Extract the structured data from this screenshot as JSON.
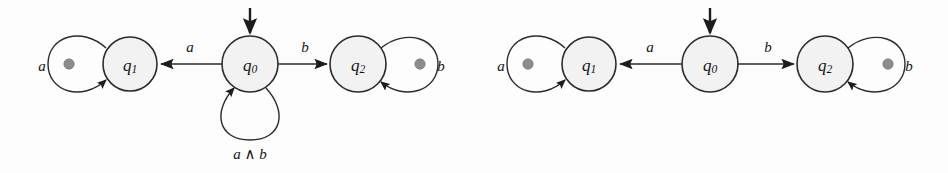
{
  "figure": {
    "background_color": "#fdfdfd",
    "stroke_color": "#2b2b2b",
    "state_fill_color": "#f2f2f2",
    "marker_dot_color": "#8c8c8c"
  },
  "automata": [
    {
      "id": "left-automaton",
      "states": [
        {
          "id": "q1",
          "name": "q",
          "subscript": "1",
          "cx": 130,
          "cy": 64,
          "r": 27
        },
        {
          "id": "q0",
          "name": "q",
          "subscript": "0",
          "cx": 250,
          "cy": 64,
          "r": 28,
          "initial": true
        },
        {
          "id": "q2",
          "name": "q",
          "subscript": "2",
          "cx": 358,
          "cy": 64,
          "r": 28
        }
      ],
      "transitions": [
        {
          "id": "q0-to-q1",
          "from": "q0",
          "to": "q1",
          "label": "a",
          "label_x": 190,
          "label_y": 47
        },
        {
          "id": "q0-to-q2",
          "from": "q0",
          "to": "q2",
          "label": "b",
          "label_x": 305,
          "label_y": 47
        },
        {
          "id": "q1-self",
          "from": "q1",
          "to": "q1",
          "label": "a",
          "label_x": 42,
          "label_y": 66,
          "self_loop": true,
          "side": "left",
          "dot": true
        },
        {
          "id": "q2-self",
          "from": "q2",
          "to": "q2",
          "label": "b",
          "label_x": 438,
          "label_y": 66,
          "self_loop": true,
          "side": "right",
          "dot": true
        },
        {
          "id": "q0-self",
          "from": "q0",
          "to": "q0",
          "label": "a ∧ b",
          "label_x": 250,
          "label_y": 152,
          "self_loop": true,
          "side": "bottom",
          "dot": false
        }
      ]
    },
    {
      "id": "right-automaton",
      "states": [
        {
          "id": "q1",
          "name": "q",
          "subscript": "1",
          "cx": 589,
          "cy": 64,
          "r": 27
        },
        {
          "id": "q0",
          "name": "q",
          "subscript": "0",
          "cx": 710,
          "cy": 64,
          "r": 28,
          "initial": true
        },
        {
          "id": "q2",
          "name": "q",
          "subscript": "2",
          "cx": 825,
          "cy": 64,
          "r": 28
        }
      ],
      "transitions": [
        {
          "id": "q0-to-q1",
          "from": "q0",
          "to": "q1",
          "label": "a",
          "label_x": 650,
          "label_y": 47
        },
        {
          "id": "q0-to-q2",
          "from": "q0",
          "to": "q2",
          "label": "b",
          "label_x": 768,
          "label_y": 47
        },
        {
          "id": "q1-self",
          "from": "q1",
          "to": "q1",
          "label": "a",
          "label_x": 500,
          "label_y": 66,
          "self_loop": true,
          "side": "left",
          "dot": true
        },
        {
          "id": "q2-self",
          "from": "q2",
          "to": "q2",
          "label": "b",
          "label_x": 905,
          "label_y": 66,
          "self_loop": true,
          "side": "right",
          "dot": true
        }
      ]
    }
  ],
  "labels": {
    "left": {
      "q1_state": "q",
      "q1_sub": "1",
      "q0_state": "q",
      "q0_sub": "0",
      "q2_state": "q",
      "q2_sub": "2",
      "edge_a": "a",
      "edge_b": "b",
      "loop_q1": "a",
      "loop_q2": "b",
      "loop_q0": "a ∧ b"
    },
    "right": {
      "q1_state": "q",
      "q1_sub": "1",
      "q0_state": "q",
      "q0_sub": "0",
      "q2_state": "q",
      "q2_sub": "2",
      "edge_a": "a",
      "edge_b": "b",
      "loop_q1": "a",
      "loop_q2": "b"
    }
  }
}
